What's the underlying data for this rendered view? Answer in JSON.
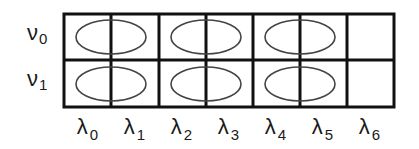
{
  "rows": [
    {
      "symbol": "ν",
      "index": "0"
    },
    {
      "symbol": "ν",
      "index": "1"
    }
  ],
  "columns": [
    {
      "symbol": "λ",
      "index": "0"
    },
    {
      "symbol": "λ",
      "index": "1"
    },
    {
      "symbol": "λ",
      "index": "2"
    },
    {
      "symbol": "λ",
      "index": "3"
    },
    {
      "symbol": "λ",
      "index": "4"
    },
    {
      "symbol": "λ",
      "index": "5"
    },
    {
      "symbol": "λ",
      "index": "6"
    }
  ],
  "ellipses": [
    {
      "row": 0,
      "cols": [
        0,
        1
      ]
    },
    {
      "row": 0,
      "cols": [
        2,
        3
      ]
    },
    {
      "row": 0,
      "cols": [
        4,
        5
      ]
    },
    {
      "row": 1,
      "cols": [
        0,
        1
      ]
    },
    {
      "row": 1,
      "cols": [
        2,
        3
      ]
    },
    {
      "row": 1,
      "cols": [
        4,
        5
      ]
    }
  ],
  "colors": {
    "line": "#111111",
    "ellipse": "#444444",
    "background": "#ffffff"
  }
}
